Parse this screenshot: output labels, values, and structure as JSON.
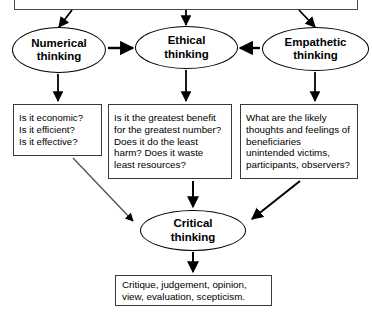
{
  "diagram": {
    "background_color": "#ffffff",
    "line_color": "#000000",
    "box_border_color": "#3a3a3a",
    "top_source": {
      "label": "",
      "note": "box is cropped off the top edge of the image; no legible text"
    },
    "modes": [
      {
        "id": "numerical",
        "label": "Numerical\nthinking",
        "questions": "Is it economic?\nIs it efficient?\nIs it effective?"
      },
      {
        "id": "ethical",
        "label": "Ethical\nthinking",
        "questions": "Is it the greatest benefit for the greatest number? Does it do the least harm? Does it waste least resources?"
      },
      {
        "id": "empathetic",
        "label": "Empathetic\nthinking",
        "questions": "What are the likely thoughts and feelings of beneficiaries unintended victims, participants, observers?"
      }
    ],
    "synthesis": {
      "label": "Critical\nthinking"
    },
    "outcome": {
      "label": "Critique, judgement, opinion, view, evaluation, scepticism."
    },
    "connections": [
      {
        "from": "top-source",
        "to": "numerical",
        "style": "diagonal-arrow"
      },
      {
        "from": "top-source",
        "to": "ethical",
        "style": "vertical-arrow"
      },
      {
        "from": "top-source",
        "to": "empathetic",
        "style": "diagonal-arrow"
      },
      {
        "from": "numerical",
        "to": "ethical",
        "style": "horizontal-arrow"
      },
      {
        "from": "empathetic",
        "to": "ethical",
        "style": "horizontal-arrow"
      },
      {
        "from": "numerical",
        "to": "box-numerical",
        "style": "vertical-arrow"
      },
      {
        "from": "ethical",
        "to": "box-ethical",
        "style": "vertical-arrow"
      },
      {
        "from": "empathetic",
        "to": "box-empathetic",
        "style": "vertical-arrow"
      },
      {
        "from": "box-numerical",
        "to": "critical",
        "style": "diagonal-arrow"
      },
      {
        "from": "box-ethical",
        "to": "critical",
        "style": "vertical-arrow"
      },
      {
        "from": "box-empathetic",
        "to": "critical",
        "style": "diagonal-arrow"
      },
      {
        "from": "critical",
        "to": "outcome",
        "style": "vertical-arrow"
      }
    ]
  }
}
